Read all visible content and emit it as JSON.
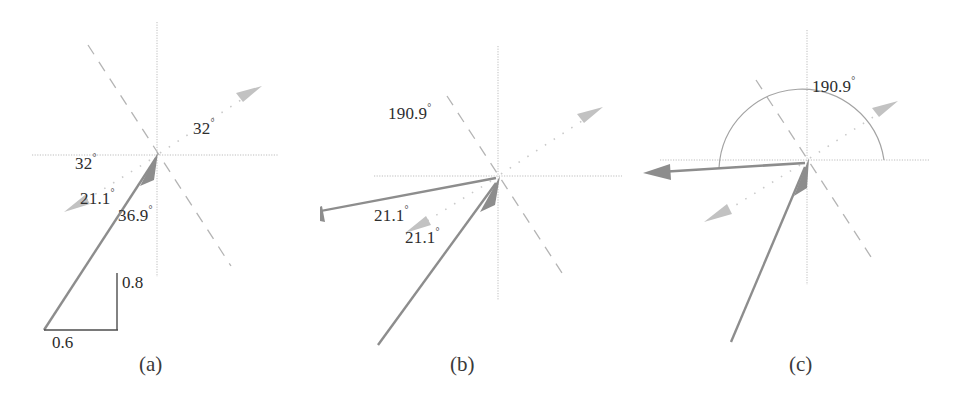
{
  "figure": {
    "background_color": "#ffffff",
    "width": 961,
    "height": 399,
    "axis_color": "#b9b9b9",
    "dashed_color": "#b4b4b4",
    "dotted_color": "#c8c8c8",
    "solid_vector_color": "#8a8a8a",
    "triangle_color": "#555555",
    "arc_color": "#9a9a9a",
    "text_color": "#2e2e2e"
  },
  "panels": [
    {
      "id": "panel-a",
      "caption": "(a)",
      "caption_x": 139,
      "caption_y": 352,
      "origin": {
        "x": 157,
        "y": 155
      },
      "axes": {
        "x_from": 32,
        "x_to": 278,
        "y_from": 22,
        "y_to": 277
      },
      "dashed_line": {
        "angle_deg": 122,
        "length_pos": 130,
        "length_neg": 140
      },
      "dotted_arrow_upper": {
        "angle_deg": 32,
        "length": 112,
        "label": "32°"
      },
      "dotted_arrow_lower": {
        "angle_deg": 212,
        "length": 100,
        "label": "32°"
      },
      "solid_vector": {
        "angle_deg": 216.9,
        "length": 160,
        "label": "36.9°"
      },
      "triangle": {
        "apex_x": 117,
        "apex_y": 273,
        "corner_x": 44,
        "corner_y": 330,
        "foot_x": 117,
        "foot_y": 330,
        "vertical_label": "0.8",
        "horizontal_label": "0.6"
      },
      "labels": [
        {
          "name": "angle-32-upper",
          "text": "32",
          "deg": "°",
          "x": 193,
          "y": 127
        },
        {
          "name": "angle-32-lower",
          "text": "32",
          "deg": "°",
          "x": 75,
          "y": 162
        },
        {
          "name": "angle-21-1",
          "text": "21.1",
          "deg": "°",
          "x": 80,
          "y": 197
        },
        {
          "name": "angle-36-9",
          "text": "36.9",
          "deg": "°",
          "x": 118,
          "y": 214
        },
        {
          "name": "length-0-8",
          "text": "0.8",
          "x": 122,
          "y": 272
        },
        {
          "name": "length-0-6",
          "text": "0.6",
          "x": 52,
          "y": 333
        }
      ]
    },
    {
      "id": "panel-b",
      "caption": "(b)",
      "caption_x": 450,
      "caption_y": 352,
      "origin": {
        "x": 498,
        "y": 176
      },
      "axes": {
        "x_from": 374,
        "x_to": 622,
        "y_from": 46,
        "y_to": 300
      },
      "dashed_line": {
        "angle_deg": 122,
        "length_pos": 96,
        "length_neg": 120
      },
      "dotted_arrow_upper": {
        "angle_deg": 32,
        "length": 112,
        "label": "190.9°"
      },
      "dotted_arrow_lower": {
        "angle_deg": 212,
        "length": 100,
        "label": "21.1°"
      },
      "solid_vector_left": {
        "angle_deg": 190.9,
        "length": 205,
        "label": "21.1°"
      },
      "solid_vector_lower": {
        "angle_deg": 237,
        "length": 190
      },
      "labels": [
        {
          "name": "angle-190-9",
          "text": "190.9",
          "deg": "°",
          "x": 388,
          "y": 112
        },
        {
          "name": "angle-21-1-upper",
          "text": "21.1",
          "deg": "°",
          "x": 374,
          "y": 214
        },
        {
          "name": "angle-21-1-lower",
          "text": "21.1",
          "deg": "°",
          "x": 405,
          "y": 236
        }
      ]
    },
    {
      "id": "panel-c",
      "caption": "(c)",
      "caption_x": 789,
      "caption_y": 352,
      "origin": {
        "x": 807,
        "y": 160
      },
      "axes": {
        "x_from": 660,
        "x_to": 930,
        "y_from": 30,
        "y_to": 285
      },
      "dashed_line": {
        "angle_deg": 122,
        "length_pos": 96,
        "length_neg": 120
      },
      "dotted_arrow_upper": {
        "angle_deg": 32,
        "length": 112,
        "label": "190.9°"
      },
      "dotted_arrow_lower": {
        "angle_deg": 212,
        "length": 120
      },
      "solid_vector_left": {
        "angle_deg": 183,
        "length": 158
      },
      "solid_vector_lower": {
        "angle_deg": 250,
        "length": 200
      },
      "arc": {
        "cx": 801,
        "cy": 160,
        "r": 83,
        "from_deg": 0,
        "to_deg": 190.9
      },
      "labels": [
        {
          "name": "angle-190-9",
          "text": "190.9",
          "deg": "°",
          "x": 812,
          "y": 85
        }
      ]
    }
  ]
}
